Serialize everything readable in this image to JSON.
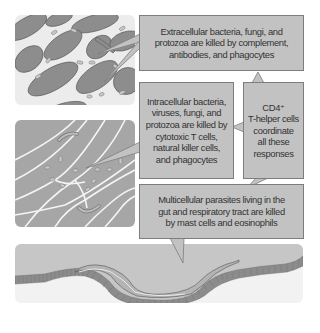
{
  "diagram": {
    "title": "",
    "callouts": {
      "extracellular": {
        "lines": [
          "Extracellular bacteria, fungi, and",
          "protozoa are killed by complement,",
          "antibodies, and phagocytes"
        ]
      },
      "intracellular": {
        "lines": [
          "Intracellular bacteria,",
          "viruses, fungi, and",
          "protozoa are killed by",
          "cytotoxic T cells,",
          "natural killer cells,",
          "and phagocytes"
        ]
      },
      "cd4": {
        "lines": [
          "CD4⁺",
          "T-helper cells",
          "coordinate",
          "all these",
          "responses"
        ]
      },
      "multicellular": {
        "lines": [
          "Multicellular parasites living in the",
          "gut and respiratory tract are killed",
          "by mast cells and eosinophils"
        ]
      }
    },
    "panels": {
      "extracellular": "Extracellular space with tissue cells and pathogens",
      "intracellular": "Tissue cells with intracellular pathogens",
      "gut": "Multicellular worm parasite in gut epithelium"
    },
    "colors": {
      "callout_fill": "#c2c2c2",
      "callout_border": "#7d7d7d",
      "cell_fill": "#8c8c8c",
      "panel_light": "#ececec",
      "text": "#333333"
    }
  }
}
